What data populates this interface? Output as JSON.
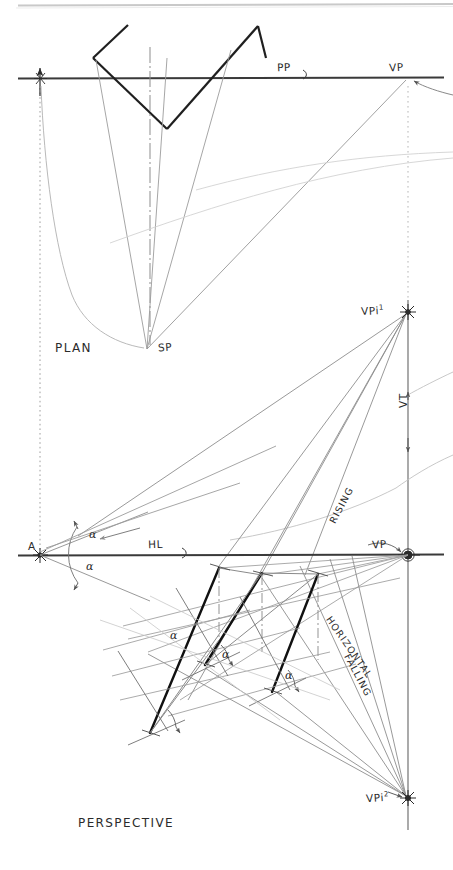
{
  "drawing": {
    "title_plan": "PLAN",
    "title_perspective": "PERSPECTIVE",
    "background_color": "#ffffff",
    "ink_color": "#2b2b2b",
    "construction_color": "#9a9a9a",
    "faint_color": "#cfcfcf",
    "bold_color": "#1a1a1a"
  },
  "labels": {
    "picture_plane": "PP",
    "vanishing_point_plan": "VP",
    "station_point": "SP",
    "plan": "PLAN",
    "vpi_one": "VPi",
    "vpi_one_sup": "1",
    "vertical_trace": "VT",
    "point_a": "A",
    "horizon_line": "HL",
    "vanishing_point_persp": "VP",
    "rising": "RISING",
    "horizontal": "HORIZONTAL",
    "falling": "FALLING",
    "vpi_two": "VPi",
    "vpi_two_sup": "2",
    "perspective": "PERSPECTIVE",
    "alpha": "α"
  },
  "angles": {
    "alpha_1": "α",
    "alpha_2": "α",
    "alpha_3": "α",
    "alpha_4": "α",
    "alpha_5": "α"
  },
  "geometry": {
    "picture_plane_y": 78,
    "horizon_line_y": 555,
    "station_point": {
      "x": 147,
      "y": 349
    },
    "vp_plan": {
      "x": 408,
      "y": 78
    },
    "vpi_1": {
      "x": 408,
      "y": 312
    },
    "vp_persp": {
      "x": 408,
      "y": 555
    },
    "vpi_2": {
      "x": 408,
      "y": 798
    },
    "point_a": {
      "x": 40,
      "y": 555
    },
    "vertical_line_x": 408,
    "left_vertical_x": 40
  }
}
